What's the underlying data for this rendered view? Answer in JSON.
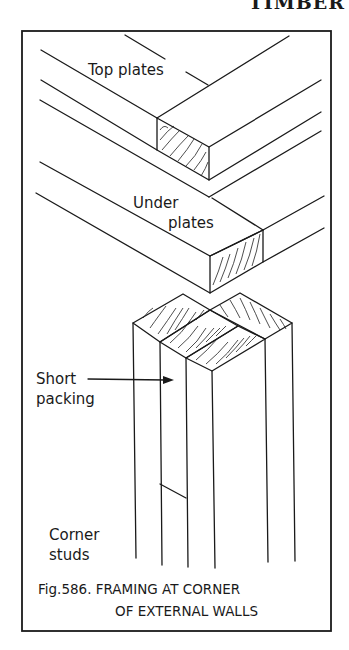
{
  "page": {
    "header": "TIMBER"
  },
  "figure": {
    "number": "Fig.586.",
    "caption_line1": "Fig.586. FRAMING AT CORNER",
    "caption_line2": "OF EXTERNAL WALLS",
    "labels": {
      "top_plates": "Top plates",
      "under_plates_1": "Under",
      "under_plates_2": "plates",
      "short_packing_1": "Short",
      "short_packing_2": "packing",
      "corner_studs_1": "Corner",
      "corner_studs_2": "studs"
    },
    "colors": {
      "ink": "#1a1a1a",
      "paper": "#ffffff"
    }
  }
}
